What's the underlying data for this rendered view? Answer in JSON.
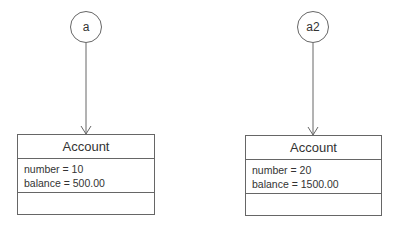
{
  "references": [
    {
      "name": "a",
      "target": 0
    },
    {
      "name": "a2",
      "target": 1
    }
  ],
  "objects": [
    {
      "class_name": "Account",
      "attributes": [
        "number = 10",
        "balance = 500.00"
      ],
      "operations": []
    },
    {
      "class_name": "Account",
      "attributes": [
        "number = 20",
        "balance = 1500.00"
      ],
      "operations": []
    }
  ],
  "colors": {
    "line": "#666666",
    "text": "#333333",
    "background": "#ffffff"
  }
}
